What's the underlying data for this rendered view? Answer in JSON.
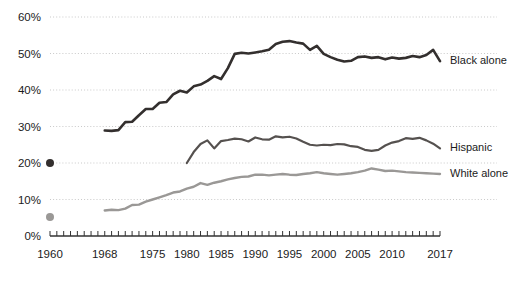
{
  "chart_data": {
    "type": "line",
    "title": "",
    "xlabel": "",
    "ylabel": "",
    "xlim": [
      1960,
      2017
    ],
    "ylim": [
      0,
      60
    ],
    "grid": true,
    "grid_axis": "y",
    "legend_position": "right-inline",
    "y_ticks": [
      0,
      10,
      20,
      30,
      40,
      50,
      60
    ],
    "y_tick_labels": [
      "0%",
      "10%",
      "20%",
      "30%",
      "40%",
      "50%",
      "60%"
    ],
    "x_tick_labels": [
      "1960",
      "1968",
      "1975",
      "1980",
      "1985",
      "1990",
      "1995",
      "2000",
      "2005",
      "2010",
      "2017"
    ],
    "x_tick_label_values": [
      1960,
      1968,
      1975,
      1980,
      1985,
      1990,
      1995,
      2000,
      2005,
      2010,
      2017
    ],
    "x_minor_tick_interval": 1,
    "series": [
      {
        "name": "Black alone",
        "color": "#332f2e",
        "marker_points": [
          {
            "x": 1960,
            "y": 20.0
          }
        ],
        "x": [
          1968,
          1969,
          1970,
          1971,
          1972,
          1973,
          1974,
          1975,
          1976,
          1977,
          1978,
          1979,
          1980,
          1981,
          1982,
          1983,
          1984,
          1985,
          1986,
          1987,
          1988,
          1989,
          1990,
          1991,
          1992,
          1993,
          1994,
          1995,
          1996,
          1997,
          1998,
          1999,
          2000,
          2001,
          2002,
          2003,
          2004,
          2005,
          2006,
          2007,
          2008,
          2009,
          2010,
          2011,
          2012,
          2013,
          2014,
          2015,
          2016,
          2017
        ],
        "values": [
          28.9,
          28.8,
          29.0,
          31.2,
          31.3,
          33.1,
          34.8,
          34.8,
          36.5,
          36.7,
          38.8,
          39.8,
          39.3,
          41.0,
          41.5,
          42.5,
          43.8,
          43.0,
          46.0,
          49.9,
          50.2,
          50.0,
          50.3,
          50.6,
          51.0,
          52.6,
          53.2,
          53.4,
          53.0,
          52.7,
          51.0,
          52.1,
          49.9,
          49.0,
          48.3,
          47.8,
          48.0,
          49.0,
          49.2,
          48.8,
          49.0,
          48.4,
          48.9,
          48.6,
          48.8,
          49.3,
          49.0,
          49.6,
          51.0,
          47.9
        ]
      },
      {
        "name": "Hispanic",
        "color": "#55514f",
        "marker_points": [],
        "x": [
          1980,
          1981,
          1982,
          1983,
          1984,
          1985,
          1986,
          1987,
          1988,
          1989,
          1990,
          1991,
          1992,
          1993,
          1994,
          1995,
          1996,
          1997,
          1998,
          1999,
          2000,
          2001,
          2002,
          2003,
          2004,
          2005,
          2006,
          2007,
          2008,
          2009,
          2010,
          2011,
          2012,
          2013,
          2014,
          2015,
          2016,
          2017
        ],
        "values": [
          20.0,
          23.0,
          25.2,
          26.2,
          24.0,
          26.0,
          26.3,
          26.7,
          26.5,
          25.9,
          27.0,
          26.5,
          26.4,
          27.3,
          27.0,
          27.2,
          26.7,
          25.8,
          25.0,
          24.8,
          25.0,
          24.9,
          25.2,
          25.1,
          24.6,
          24.4,
          23.6,
          23.3,
          23.6,
          24.8,
          25.6,
          26.0,
          26.8,
          26.6,
          26.9,
          26.2,
          25.3,
          24.0
        ]
      },
      {
        "name": "White alone",
        "color": "#9a9896",
        "marker_points": [
          {
            "x": 1960,
            "y": 5.2
          }
        ],
        "x": [
          1968,
          1969,
          1970,
          1971,
          1972,
          1973,
          1974,
          1975,
          1976,
          1977,
          1978,
          1979,
          1980,
          1981,
          1982,
          1983,
          1984,
          1985,
          1986,
          1987,
          1988,
          1989,
          1990,
          1991,
          1992,
          1993,
          1994,
          1995,
          1996,
          1997,
          1998,
          1999,
          2000,
          2001,
          2002,
          2003,
          2004,
          2005,
          2006,
          2007,
          2008,
          2009,
          2010,
          2011,
          2012,
          2013,
          2014,
          2015,
          2016,
          2017
        ],
        "values": [
          7.0,
          7.2,
          7.1,
          7.5,
          8.5,
          8.6,
          9.4,
          10.0,
          10.6,
          11.2,
          11.9,
          12.2,
          13.0,
          13.5,
          14.5,
          14.0,
          14.6,
          15.0,
          15.5,
          15.9,
          16.2,
          16.3,
          16.8,
          16.8,
          16.6,
          16.8,
          17.0,
          16.8,
          16.7,
          17.0,
          17.2,
          17.5,
          17.2,
          17.0,
          16.8,
          17.0,
          17.2,
          17.5,
          17.9,
          18.5,
          18.2,
          17.8,
          17.9,
          17.7,
          17.5,
          17.4,
          17.3,
          17.2,
          17.1,
          17.0
        ]
      }
    ]
  },
  "axis": {
    "axis_line_color": "#333333",
    "grid_color": "#c9c9c9"
  }
}
